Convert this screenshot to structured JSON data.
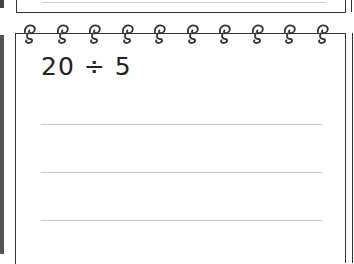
{
  "notebook": {
    "problem": "20 ÷ 5",
    "ruled_lines": 3,
    "spiral_rings": 10,
    "colors": {
      "ink": "#222222",
      "rule": "#c8c8c8",
      "border": "#333333"
    }
  }
}
